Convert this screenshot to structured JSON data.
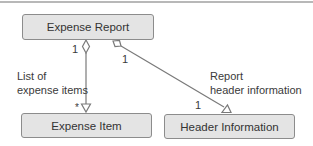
{
  "diagram": {
    "type": "uml-class-aggregation",
    "classes": [
      {
        "id": "expense-report",
        "name": "Expense Report"
      },
      {
        "id": "expense-item",
        "name": "Expense Item"
      },
      {
        "id": "header-information",
        "name": "Header Information"
      }
    ],
    "associations": [
      {
        "from": "expense-report",
        "to": "expense-item",
        "kind": "aggregation",
        "source_multiplicity": "1",
        "target_multiplicity": "*",
        "label_line1": "List of",
        "label_line2": "expense items"
      },
      {
        "from": "expense-report",
        "to": "header-information",
        "kind": "aggregation",
        "source_multiplicity": "1",
        "target_multiplicity": "1",
        "label_line1": "Report",
        "label_line2": "header information"
      }
    ]
  },
  "colors": {
    "box_fill": "#e4e4e4",
    "box_border": "#8c8c8c",
    "line": "#7a7a7a",
    "text": "#333333"
  }
}
